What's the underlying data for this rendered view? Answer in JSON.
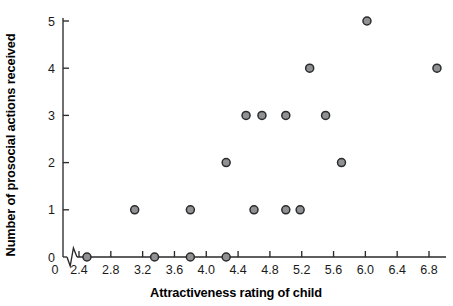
{
  "chart_data": {
    "type": "scatter",
    "title": "",
    "xlabel": "Attractiveness rating of child",
    "ylabel": "Number of prosocial actions received",
    "xlim": [
      2.2,
      7.0
    ],
    "ylim": [
      0,
      5
    ],
    "xticks": [
      "2.4",
      "2.8",
      "3.2",
      "3.6",
      "4.0",
      "4.4",
      "4.8",
      "5.2",
      "5.6",
      "6.0",
      "6.4",
      "6.8"
    ],
    "xtick_values": [
      2.4,
      2.8,
      3.2,
      3.6,
      4.0,
      4.4,
      4.8,
      5.2,
      5.6,
      6.0,
      6.4,
      6.8
    ],
    "yticks": [
      "0",
      "1",
      "2",
      "3",
      "4",
      "5"
    ],
    "ytick_values": [
      0,
      1,
      2,
      3,
      4,
      5
    ],
    "origin_label": "0",
    "axis_break": true,
    "grid": false,
    "legend": false,
    "marker": "filled-circle",
    "marker_fill": "#8f9194",
    "marker_edge": "#2b2b2b",
    "points": [
      {
        "x": 2.5,
        "y": 0
      },
      {
        "x": 3.35,
        "y": 0
      },
      {
        "x": 3.8,
        "y": 0
      },
      {
        "x": 4.25,
        "y": 0
      },
      {
        "x": 3.1,
        "y": 1
      },
      {
        "x": 3.8,
        "y": 1
      },
      {
        "x": 4.6,
        "y": 1
      },
      {
        "x": 5.0,
        "y": 1
      },
      {
        "x": 5.18,
        "y": 1
      },
      {
        "x": 4.25,
        "y": 2
      },
      {
        "x": 5.7,
        "y": 2
      },
      {
        "x": 4.5,
        "y": 3
      },
      {
        "x": 4.7,
        "y": 3
      },
      {
        "x": 5.0,
        "y": 3
      },
      {
        "x": 5.5,
        "y": 3
      },
      {
        "x": 5.3,
        "y": 4
      },
      {
        "x": 6.9,
        "y": 4
      },
      {
        "x": 6.02,
        "y": 5
      }
    ]
  }
}
